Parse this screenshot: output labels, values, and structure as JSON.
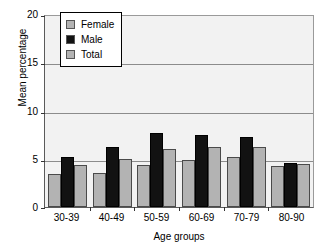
{
  "chart_data": {
    "type": "bar",
    "title": "",
    "xlabel": "Age groups",
    "ylabel": "Mean percentage",
    "categories": [
      "30-39",
      "40-49",
      "50-59",
      "60-69",
      "70-79",
      "80-90"
    ],
    "series": [
      {
        "name": "Female",
        "color": "#b3b3b3",
        "values": [
          3.4,
          3.5,
          4.4,
          4.9,
          5.2,
          4.3
        ]
      },
      {
        "name": "Male",
        "color": "#121212",
        "values": [
          5.2,
          6.2,
          7.7,
          7.5,
          7.3,
          4.6
        ]
      },
      {
        "name": "Total",
        "color": "#b3b3b3",
        "values": [
          4.4,
          5.0,
          6.0,
          6.2,
          6.2,
          4.5
        ]
      }
    ],
    "ylim": [
      0,
      20
    ],
    "yticks": [
      0,
      5,
      10,
      15,
      20
    ],
    "ytick_labels": [
      "0",
      "5",
      "10",
      "15",
      "20"
    ],
    "grid": true,
    "grid_axis": "y",
    "legend_position": "upper-left-inside",
    "plot_background": "#f2f2f2",
    "figure_background": "#ffffff"
  }
}
